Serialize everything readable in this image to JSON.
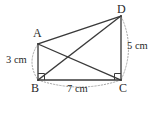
{
  "figure": {
    "stroke_color": "#3a3a3a",
    "dotted_color": "#9a9a9a",
    "background_color": "#ffffff",
    "vertices": [
      {
        "name": "A",
        "label": "A",
        "x": 38,
        "y": 44
      },
      {
        "name": "B",
        "label": "B",
        "x": 38,
        "y": 80
      },
      {
        "name": "C",
        "label": "C",
        "x": 121,
        "y": 80
      },
      {
        "name": "D",
        "label": "D",
        "x": 121,
        "y": 16
      }
    ],
    "segments": [
      {
        "name": "segment-ab",
        "from": "A",
        "to": "B",
        "style": "solid"
      },
      {
        "name": "segment-bc",
        "from": "B",
        "to": "C",
        "style": "solid"
      },
      {
        "name": "segment-dc",
        "from": "D",
        "to": "C",
        "style": "solid"
      },
      {
        "name": "segment-ad",
        "from": "A",
        "to": "D",
        "style": "solid"
      },
      {
        "name": "segment-ac",
        "from": "A",
        "to": "C",
        "style": "solid"
      },
      {
        "name": "segment-bd",
        "from": "B",
        "to": "D",
        "style": "solid"
      }
    ],
    "right_angles": [
      {
        "name": "right-angle-b",
        "at": "B"
      },
      {
        "name": "right-angle-c",
        "at": "C"
      }
    ],
    "measures": [
      {
        "name": "side-ab",
        "label": "3 cm",
        "value": 3,
        "unit": "cm",
        "side": "AB"
      },
      {
        "name": "side-dc",
        "label": "5 cm",
        "value": 5,
        "unit": "cm",
        "side": "DC"
      },
      {
        "name": "side-bc",
        "label": "7 cm",
        "value": 7,
        "unit": "cm",
        "side": "BC"
      }
    ]
  }
}
